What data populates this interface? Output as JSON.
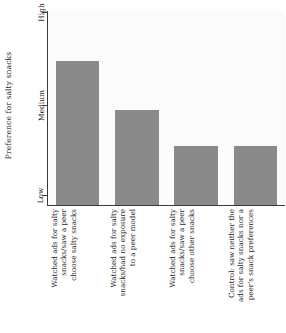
{
  "chart_data": {
    "type": "bar",
    "title": "",
    "xlabel": "",
    "ylabel": "Preference for salty snacks",
    "categories": [
      "Watched ads for salty snacks/saw a peer choose salty snacks",
      "Watched ads for salty snacks/had no exposure to a peer model",
      "Watched ads for salty snacks/saw a peer choose other snacks",
      "Control: saw neither the ads for salty snacks nor a peer's snack preferences"
    ],
    "category_lines": [
      [
        "Watched ads for salty",
        "snacks/saw a peer",
        "choose salty snacks"
      ],
      [
        "Watched ads for salty",
        "snacks/had no exposure",
        "to a peer model"
      ],
      [
        "Watched ads for salty",
        "snacks/saw a peer",
        "choose other snacks"
      ],
      [
        "Control: saw neither the",
        "ads for salty snacks nor a",
        "peer's snack preferences"
      ]
    ],
    "values": [
      1.6,
      1.05,
      0.65,
      0.65
    ],
    "ytick_labels": [
      "Low",
      "Medium",
      "High"
    ],
    "ytick_values": [
      0,
      1,
      2
    ],
    "ylim": [
      0,
      2.15
    ],
    "grid": false,
    "legend": null,
    "bar_color": "#8a8a8a",
    "axis_color": "#3a3a3a",
    "plot_background": "#fbfbfb"
  },
  "axis": {
    "y_title": "Preference for salty snacks",
    "tick_high": "High",
    "tick_medium": "Medium",
    "tick_low": "Low"
  },
  "bars": [
    {
      "line1": "Watched ads for salty",
      "line2": "snacks/saw a peer",
      "line3": "choose salty snacks"
    },
    {
      "line1": "Watched ads for salty",
      "line2": "snacks/had no exposure",
      "line3": "to a peer model"
    },
    {
      "line1": "Watched ads for salty",
      "line2": "snacks/saw a peer",
      "line3": "choose other snacks"
    },
    {
      "line1": "Control: saw neither the",
      "line2": "ads for salty snacks nor a",
      "line3": "peer's snack preferences"
    }
  ]
}
